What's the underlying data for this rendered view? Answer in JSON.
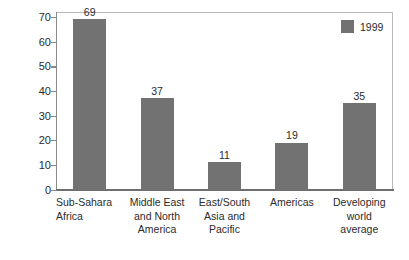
{
  "chart_data": {
    "type": "bar",
    "title": "",
    "xlabel": "",
    "ylabel": "External debt-to-GNP ratio",
    "ylim": [
      0,
      72
    ],
    "grid": false,
    "legend_position": "top-right",
    "yticks": [
      0,
      10,
      20,
      30,
      40,
      50,
      60,
      70
    ],
    "ytick_labels": [
      "0",
      "10",
      "20",
      "30",
      "40",
      "50",
      "60",
      "70"
    ],
    "categories": [
      "Sub-Sahara Africa",
      "Middle East and North America",
      "East/South Asia and Pacific",
      "Americas",
      "Developing world average"
    ],
    "category_lines": [
      [
        "Sub-Sahara",
        "Africa"
      ],
      [
        "Middle East",
        "and North",
        "America"
      ],
      [
        "East/South",
        "Asia and",
        "Pacific"
      ],
      [
        "Americas"
      ],
      [
        "Developing",
        "world",
        "average"
      ]
    ],
    "series": [
      {
        "name": "1999",
        "values": [
          69,
          37,
          11,
          19,
          35
        ],
        "color": "#727272"
      }
    ],
    "value_labels": [
      "69",
      "37",
      "11",
      "19",
      "35"
    ],
    "legend": [
      {
        "label": "1999",
        "color": "#727272"
      }
    ]
  },
  "colors": {
    "bar": "#727272",
    "frame": "#b9b9b9",
    "axis": "#6e6e6e",
    "text": "#2b2b2b",
    "background": "#ffffff"
  }
}
